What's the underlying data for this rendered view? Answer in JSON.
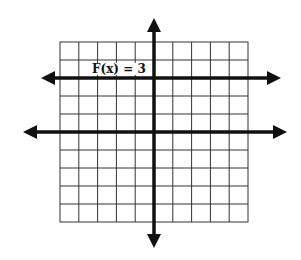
{
  "diagram": {
    "type": "coordinate-grid-graph",
    "grid": {
      "columns": 10,
      "rows": 10
    },
    "function_label": "F(x) = 3",
    "function": {
      "name": "F",
      "expression": "3",
      "kind": "horizontal line",
      "y_value": 3
    },
    "colors": {
      "lines": "#111111",
      "grid": "#333333",
      "background": "#ffffff"
    }
  }
}
